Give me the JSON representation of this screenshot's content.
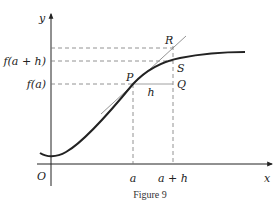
{
  "figure": {
    "caption": "Figure 9",
    "axes": {
      "x_label": "x",
      "y_label": "y",
      "origin_label": "O"
    },
    "x_ticks": [
      {
        "label": "a"
      },
      {
        "label": "a + h"
      }
    ],
    "y_ticks": [
      {
        "label": "f(a + h)"
      },
      {
        "label": "f(a)"
      }
    ],
    "points": {
      "P": "P",
      "Q": "Q",
      "R": "R",
      "S": "S"
    },
    "segment_label": "h",
    "colors": {
      "curve": "#222222",
      "tangent": "#888888",
      "dashed": "#777777",
      "axes": "#222222"
    }
  }
}
